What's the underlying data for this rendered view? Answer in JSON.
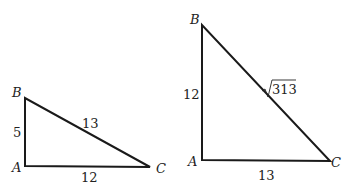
{
  "diagram": {
    "stroke_color": "#1a1a1a",
    "triangles": [
      {
        "id": "left",
        "vertices": {
          "A": {
            "label": "A",
            "x": 25,
            "y": 166
          },
          "B": {
            "label": "B",
            "x": 25,
            "y": 98
          },
          "C": {
            "label": "C",
            "x": 150,
            "y": 167
          }
        },
        "sides": {
          "AB": {
            "label": "5"
          },
          "BC": {
            "label": "13"
          },
          "AC": {
            "label": "12"
          }
        }
      },
      {
        "id": "right",
        "vertices": {
          "A": {
            "label": "A",
            "x": 202,
            "y": 160
          },
          "B": {
            "label": "B",
            "x": 202,
            "y": 25
          },
          "C": {
            "label": "C",
            "x": 330,
            "y": 161
          }
        },
        "sides": {
          "AB": {
            "label": "12"
          },
          "BC": {
            "label": "313",
            "radical": true
          },
          "AC": {
            "label": "13"
          }
        }
      }
    ]
  }
}
